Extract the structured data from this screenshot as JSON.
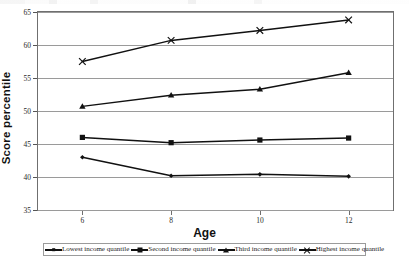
{
  "axes": {
    "ylabel": "Score percentile",
    "xlabel": "Age",
    "yticks": [
      "65",
      "60",
      "55",
      "50",
      "45",
      "40",
      "35"
    ],
    "xticks": [
      "6",
      "8",
      "10",
      "12"
    ]
  },
  "legend": {
    "items": [
      {
        "label": "Lowest income quantile",
        "marker": "diamond-marker"
      },
      {
        "label": "Second income quantile",
        "marker": "square-marker"
      },
      {
        "label": "Third income quantile",
        "marker": "triangle-marker"
      },
      {
        "label": "Highest income quantile",
        "marker": "x-marker"
      }
    ]
  },
  "chart_data": {
    "type": "line",
    "title": "",
    "xlabel": "Age",
    "ylabel": "Score percentile",
    "x": [
      6,
      8,
      10,
      12
    ],
    "xtick_labels": [
      "6",
      "8",
      "10",
      "12"
    ],
    "ytick_labels": [
      "35",
      "40",
      "45",
      "50",
      "55",
      "60",
      "65"
    ],
    "xlim": [
      5,
      13
    ],
    "ylim": [
      35,
      65
    ],
    "ytick_step": 5,
    "grid": "horizontal",
    "legend_position": "bottom",
    "series": [
      {
        "name": "Lowest income quantile",
        "marker": "diamond",
        "color": "#111111",
        "values": [
          43.0,
          40.2,
          40.4,
          40.1
        ]
      },
      {
        "name": "Second income quantile",
        "marker": "square",
        "color": "#111111",
        "values": [
          46.0,
          45.2,
          45.6,
          45.9
        ]
      },
      {
        "name": "Third income quantile",
        "marker": "triangle",
        "color": "#111111",
        "values": [
          50.7,
          52.4,
          53.3,
          55.8
        ]
      },
      {
        "name": "Highest income quantile",
        "marker": "x",
        "color": "#111111",
        "values": [
          57.5,
          60.7,
          62.2,
          63.8
        ]
      }
    ]
  }
}
